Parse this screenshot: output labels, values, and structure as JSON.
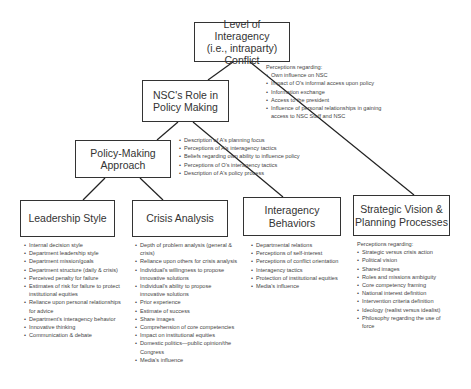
{
  "diagram": {
    "nodes": {
      "conflict": {
        "line1": "Level of Interagency",
        "line2": "(i.e., intraparty) Conflict"
      },
      "nsc_role": {
        "line1": "NSC's Role in",
        "line2": "Policy Making"
      },
      "policy_approach": {
        "line1": "Policy-Making",
        "line2": "Approach"
      },
      "leadership": {
        "label": "Leadership Style"
      },
      "crisis": {
        "label": "Crisis Analysis"
      },
      "interagency": {
        "label": "Interagency Behaviors"
      },
      "strategic": {
        "line1": "Strategic Vision &",
        "line2": "Planning Processes"
      }
    },
    "notes": {
      "conflict": {
        "header": "Perceptions regarding:",
        "items": [
          "Own influence on NSC",
          "Impact of O's informal access upon policy",
          "Information exchange",
          "Access to the president",
          "Influence of personal relationships in gaining access to NSC Staff and NSC"
        ]
      },
      "policy_approach": {
        "items": [
          "Description of A's planning focus",
          "Perceptions of A's interagency tactics",
          "Beliefs regarding own ability to influence policy",
          "Perceptions of O's interagency tactics",
          "Description of A's policy process"
        ]
      },
      "leadership": {
        "items": [
          "Internal decision style",
          "Department leadership style",
          "Department mission/goals",
          "Department structure (daily & crisis)",
          "Perceived penalty for failure",
          "Estimates of risk for failure to protect institutional equities",
          "Reliance upon personal relationships for advice",
          "Department's interagency behavior",
          "Innovative thinking",
          "Communication & debate"
        ]
      },
      "crisis": {
        "items": [
          "Depth of problem analysis (general & crisis)",
          "Reliance upon others for crisis analysis",
          "Individual's willingness to propose innovative solutions",
          "Individual's ability to propose innovative solutions",
          "Prior experience",
          "Estimate of success",
          "Share images",
          "Comprehension of core competencies",
          "Impact on institutional equities",
          "Domestic politics—public opinion/the Congress",
          "Media's influence"
        ]
      },
      "interagency": {
        "items": [
          "Departmental relations",
          "Perceptions of self-interest",
          "Perceptions of conflict orientation",
          "Interagency tactics",
          "Protection of institutional equities",
          "Media's influence"
        ]
      },
      "strategic": {
        "header": "Perceptions regarding:",
        "items": [
          "Strategic versus crisis action",
          "Political vision",
          "Shared images",
          "Roles and missions ambiguity",
          "Core competency framing",
          "National interest definition",
          "Intervention criteria definition",
          "Ideology (realist versus idealist)",
          "Philosophy regarding the use of force"
        ]
      }
    }
  }
}
